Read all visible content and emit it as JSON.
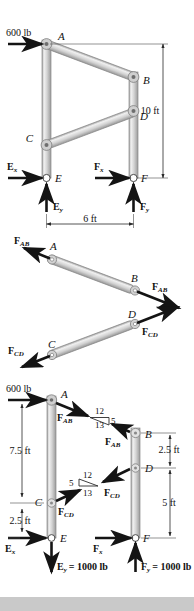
{
  "figure": {
    "parts": [
      "frame-with-supports",
      "two-force-members-fbd",
      "frame-fbd-with-slopes"
    ]
  },
  "top": {
    "applied_load": "600 lb",
    "joints": {
      "A": "A",
      "B": "B",
      "C": "C",
      "D": "D",
      "E": "E",
      "F": "F"
    },
    "dim_vertical": "10 ft",
    "dim_horizontal": "6 ft",
    "reactions": {
      "Ex": "E",
      "Ex_sub": "x",
      "Ey": "E",
      "Ey_sub": "y",
      "Fx": "F",
      "Fx_sub": "x",
      "Fy": "F",
      "Fy_sub": "y"
    }
  },
  "mid": {
    "member_ab": {
      "joint_start": "A",
      "joint_end": "B",
      "force_label": "F",
      "force_sub": "AB"
    },
    "member_cd": {
      "joint_start": "C",
      "joint_end": "D",
      "force_label": "F",
      "force_sub": "CD"
    }
  },
  "bottom": {
    "applied_load": "600 lb",
    "joints": {
      "A": "A",
      "B": "B",
      "C": "C",
      "D": "D",
      "E": "E",
      "F": "F"
    },
    "dims_left": {
      "upper": "7.5 ft",
      "lower": "2.5 ft"
    },
    "dims_right": {
      "upper": "2.5 ft",
      "lower": "5 ft"
    },
    "slope_upper": {
      "rise": "12",
      "hyp": "13",
      "run": "5"
    },
    "slope_lower": {
      "rise": "12",
      "hyp": "13",
      "run": "5"
    },
    "forces": {
      "fab_left": {
        "sym": "F",
        "sub": "AB"
      },
      "fab_right": {
        "sym": "F",
        "sub": "AB"
      },
      "fcd_left": {
        "sym": "F",
        "sub": "CD"
      },
      "fcd_right": {
        "sym": "F",
        "sub": "CD"
      },
      "ex": {
        "sym": "E",
        "sub": "x"
      },
      "fx": {
        "sym": "F",
        "sub": "x"
      },
      "ey": {
        "sym": "E",
        "sub": "y",
        "value": "= 1000 lb"
      },
      "fy": {
        "sym": "F",
        "sub": "y",
        "value": "= 1000 lb"
      }
    }
  },
  "colors": {
    "member_fill": "#d8d8d8",
    "member_edge": "#8a8a8a",
    "arrow": "#1a1a1a",
    "dim_line": "#3a3a3a",
    "footer_band": "#c9c9c9"
  }
}
